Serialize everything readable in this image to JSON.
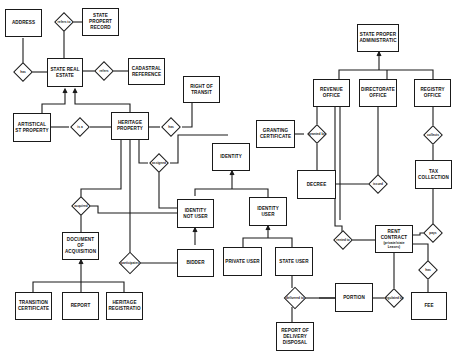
{
  "diagram": {
    "type": "entity-relationship",
    "entities": {
      "address": "Address",
      "state_property_record": "State Propert Record",
      "state_real_estate": "State Real Estate",
      "cadastral_reference": "Cadastral Reference",
      "right_of_transit": "Right of Transit",
      "artistical_property": "Artistical St Property",
      "heritage_property": "Heritage Property",
      "state_property_administration": "State Proper Administratic",
      "revenue_office": "Revenue Office",
      "directorate_office": "Directorate Office",
      "registry_office": "Registry Office",
      "granting_certificate": "Granting Certificate",
      "identity": "Identity",
      "decree": "Decree",
      "tax_collection": "Tax Collection",
      "identity_not_user": "Identity Not User",
      "identity_user": "Identity User",
      "document_of_acquisition": "Document of Acquisition",
      "bidder": "Bidder",
      "private_user": "Private User",
      "state_user": "State User",
      "rent_contract": "Rent Contract",
      "rent_contract_note": "(private/state Leases)",
      "transition_certificate": "Transition Certificate",
      "report": "Report",
      "heritage_registration": "Heritage Registratio",
      "portion": "Portion",
      "report_of_delivery": "Report of Delivery Disposal",
      "fee": "Fee"
    },
    "relationships": {
      "r_record": "refers to",
      "r_has_address": "has",
      "r_cadastral": "refers",
      "r_artistic": "is a",
      "r_transit": "has",
      "r_assigned": "assigned",
      "r_granted": "granted by",
      "r_issued": "issued",
      "r_managed": "managed by",
      "r_collects": "collects",
      "r_acquired": "acquired",
      "r_participates": "participates",
      "r_applied": "applied to",
      "r_rented": "rented to",
      "r_regulated": "regulated by",
      "r_pays": "pays",
      "r_has_fee": "has",
      "r_delivered": "delivered to"
    }
  }
}
